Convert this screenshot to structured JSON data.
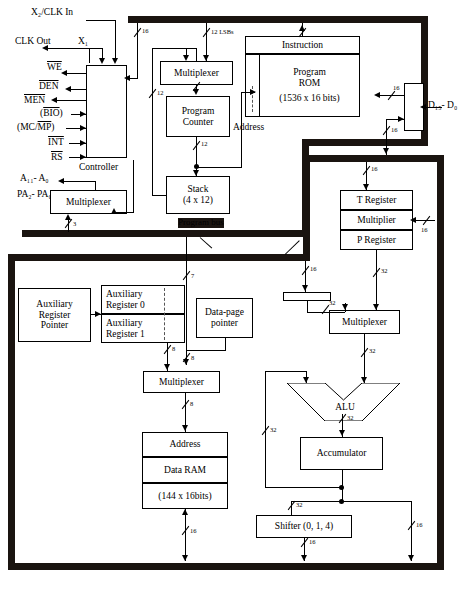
{
  "signals": {
    "clk_in": "X₂/CLK In",
    "clk_out": "CLK Out",
    "x1": "X₁",
    "we": "WE",
    "den": "DEN",
    "men": "MEN",
    "bio": "(BIO)",
    "mcmp": "(MC/MP)",
    "int": "INT",
    "rs": "RS",
    "addr_bus": "A₁₁- A₀",
    "pa_bus": "PA₂- PA₀",
    "data_bus_pins": "D₁₅- D₀"
  },
  "blocks": {
    "controller": "Controller",
    "mux_pa": "Multiplexer",
    "mux_pc": "Multiplexer",
    "program_counter_l1": "Program",
    "program_counter_l2": "Counter",
    "stack_l1": "Stack",
    "stack_l2": "(4 x 12)",
    "instruction": "Instruction",
    "program_rom_l1": "Program",
    "program_rom_l2": "ROM",
    "program_rom_size": "(1536 x 16 bits)",
    "address_label": "Address",
    "program_bus": "Program bus",
    "t_register": "T Register",
    "multiplier": "Multiplier",
    "p_register": "P Register",
    "aux_reg_ptr_l1": "Auxiliary",
    "aux_reg_ptr_l2": "Register",
    "aux_reg_ptr_l3": "Pointer",
    "aux_reg0_l1": "Auxiliary",
    "aux_reg0_l2": "Register 0",
    "aux_reg1_l1": "Auxiliary",
    "aux_reg1_l2": "Register 1",
    "data_page_l1": "Data-page",
    "data_page_l2": "pointer",
    "mux_addr": "Multiplexer",
    "ram_address": "Address",
    "data_ram": "Data RAM",
    "data_ram_size": "(144 x 16bits)",
    "mux_alu": "Multiplexer",
    "alu": "ALU",
    "accumulator": "Accumulator",
    "shifter": "Shifter (0, 1, 4)",
    "scaler": ""
  },
  "bus_widths": {
    "w16_a": "16",
    "w12_lsbs": "12 LSBs",
    "w12_a": "12",
    "w12_b": "12",
    "w3": "3",
    "w16_rom_out": "16",
    "w16_buf_out": "16",
    "w16_treg": "16",
    "w16_mult": "16",
    "w32_preg": "32",
    "w16_scaler": "16",
    "w32_scaler_out": "32",
    "w32_acc_fb": "32",
    "w32_mux_out": "32",
    "w32_alu_out": "32",
    "w32_shift_in": "32",
    "w16_shift_out": "16",
    "w16_acc_out": "16",
    "w7": "7",
    "w8_aux": "8",
    "w8_dp": "8",
    "w8_mux": "8",
    "w16_ram": "16"
  },
  "colors": {
    "bus": "#1a1410",
    "line": "#000000",
    "background": "#ffffff"
  }
}
